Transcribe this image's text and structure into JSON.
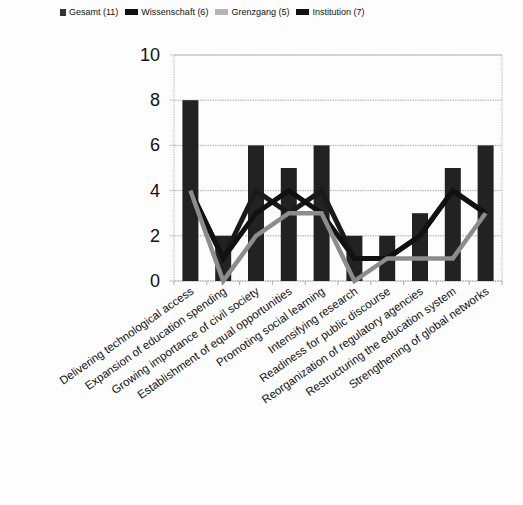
{
  "chart_data": {
    "type": "bar+line",
    "title": "",
    "xlabel": "",
    "ylabel": "",
    "ylim": [
      0,
      10
    ],
    "yticks": [
      0,
      2,
      4,
      6,
      8,
      10
    ],
    "grid": true,
    "legend_position": "top",
    "categories": [
      "Delivering technological access",
      "Expansion of education spending",
      "Growing importance of civil society",
      "Establishment of equal opportunities",
      "Promoting social learning",
      "Intensifying research",
      "Readiness for public discourse",
      "Reorganization of regulatory agencies",
      "Restructuring the education system",
      "Strengthening of global networks"
    ],
    "series": [
      {
        "name": "Gesamt (11)",
        "kind": "bar",
        "color": "#222222",
        "values": [
          8,
          2,
          6,
          5,
          6,
          2,
          2,
          3,
          5,
          6
        ]
      },
      {
        "name": "Wissenschaft (6)",
        "kind": "line",
        "color": "#1a1a1a",
        "values": [
          4,
          1,
          4,
          3,
          4,
          1,
          1,
          2,
          4,
          3
        ]
      },
      {
        "name": "Grenzgang (5)",
        "kind": "line",
        "color": "#8c8c8c",
        "values": [
          4,
          0,
          2,
          3,
          3,
          0,
          1,
          1,
          1,
          3
        ]
      },
      {
        "name": "Institution (7)",
        "kind": "line",
        "color": "#111111",
        "values": [
          4,
          1,
          3,
          4,
          3,
          1,
          1,
          2,
          4,
          3
        ]
      }
    ]
  }
}
